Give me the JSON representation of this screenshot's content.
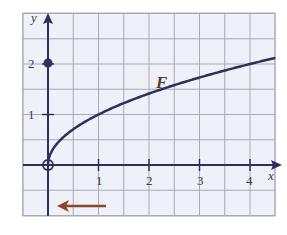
{
  "chart_data": {
    "type": "line",
    "title": "",
    "xlabel": "x",
    "ylabel": "y",
    "xlim": [
      -0.5,
      4.5
    ],
    "ylim": [
      -1,
      3
    ],
    "grid": true,
    "grid_step": 0.5,
    "x_ticks": [
      1,
      2,
      3,
      4
    ],
    "y_ticks": [
      1,
      2
    ],
    "series": [
      {
        "name": "F",
        "function": "sqrt(x)",
        "x": [
          0,
          0.25,
          0.5,
          1,
          1.5,
          2,
          2.5,
          3,
          3.5,
          4,
          4.5
        ],
        "y": [
          0,
          0.5,
          0.71,
          1,
          1.22,
          1.41,
          1.58,
          1.73,
          1.87,
          2,
          2.12
        ],
        "color": "#2d2f5e"
      }
    ],
    "points": [
      {
        "x": 0,
        "y": 0,
        "style": "open-circle"
      },
      {
        "x": 0,
        "y": 2,
        "style": "filled-circle"
      }
    ],
    "annotations": [
      {
        "text": "F",
        "x": 2.1,
        "y": 1.6
      },
      {
        "type": "arrow",
        "direction": "left",
        "from_x": 1.2,
        "to_x": 0.2,
        "y": -0.85,
        "color": "#8a4a2a"
      }
    ]
  },
  "labels": {
    "curve": "F",
    "x_axis": "x",
    "y_axis": "y",
    "x_ticks": [
      "1",
      "2",
      "3",
      "4"
    ],
    "y_ticks": [
      "1",
      "2"
    ]
  },
  "colors": {
    "grid": "#a9aab4",
    "grid_bg": "#eef1f7",
    "axis": "#2d2f5e",
    "curve": "#2d2f5e",
    "arrow": "#8a4a2a"
  }
}
